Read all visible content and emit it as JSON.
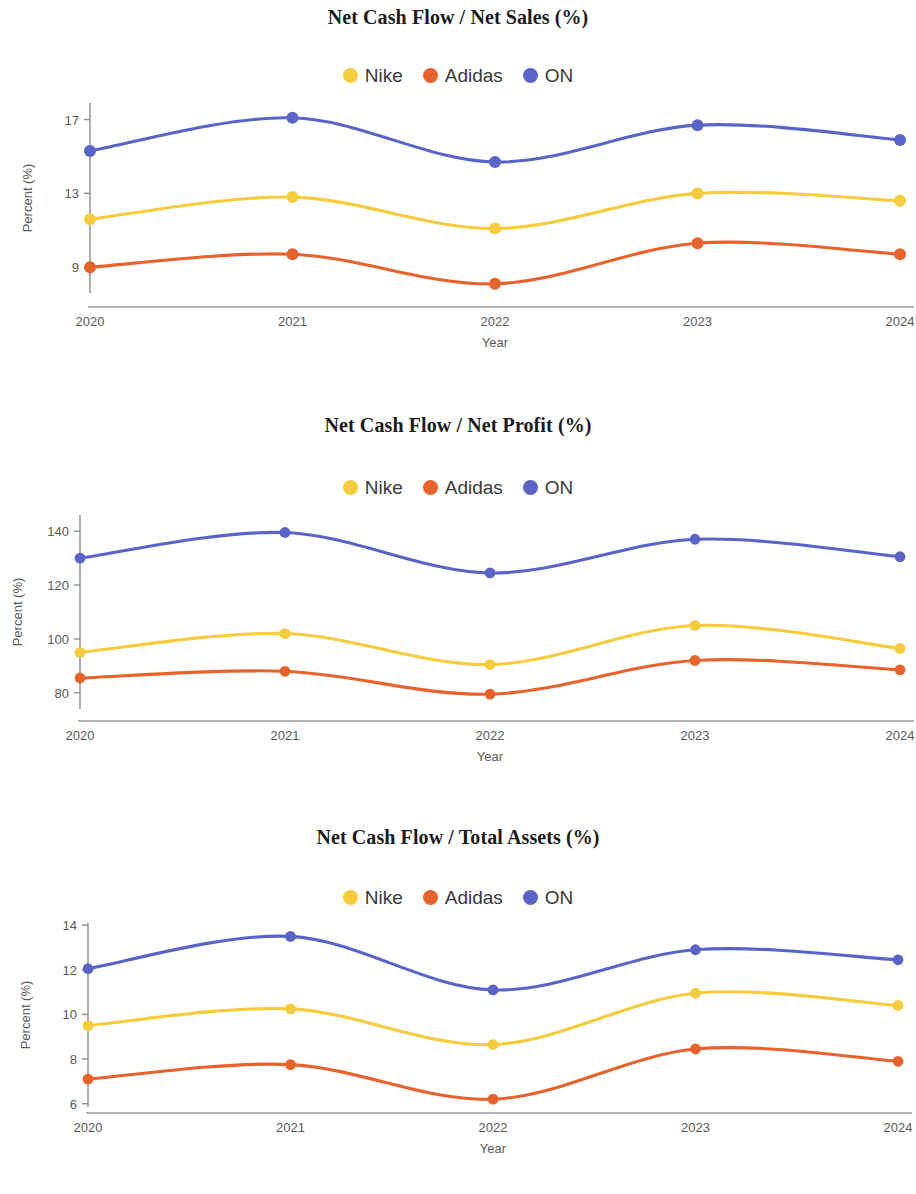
{
  "page": {
    "background": "#ffffff",
    "axis_label_x": "Year",
    "axis_label_y": "Percent (%)"
  },
  "legend": {
    "items": [
      {
        "label": "Nike",
        "color": "#f6cb3c"
      },
      {
        "label": "Adidas",
        "color": "#e8622c"
      },
      {
        "label": "ON",
        "color": "#5a64c8"
      }
    ]
  },
  "colors": {
    "nike": "#f6cb3c",
    "adidas": "#e8622c",
    "on": "#5a64c8",
    "axis": "#8b8b93",
    "tick_text": "#5a5a5a",
    "title": "#1b1b1b"
  },
  "charts": [
    {
      "id": "net-cash-flow-net-sales",
      "title": "Net Cash Flow / Net Sales (%)",
      "ticks_y": [
        "17",
        "13",
        "9"
      ]
    },
    {
      "id": "net-cash-flow-net-profit",
      "title": "Net Cash Flow / Net Profit (%)",
      "ticks_y": [
        "140",
        "120",
        "100",
        "80"
      ]
    },
    {
      "id": "net-cash-flow-total-assets",
      "title": "Net Cash Flow / Total Assets (%)",
      "ticks_y": [
        "14",
        "12",
        "10",
        "8",
        "6"
      ]
    }
  ],
  "chart_data": [
    {
      "type": "line",
      "title": "Net Cash Flow / Net Sales (%)",
      "xlabel": "Year",
      "ylabel": "Percent (%)",
      "categories": [
        "2020",
        "2021",
        "2022",
        "2023",
        "2024"
      ],
      "x": [
        2020,
        2021,
        2022,
        2023,
        2024
      ],
      "yticks": [
        9,
        13,
        17
      ],
      "ylim": [
        7.6,
        17.9
      ],
      "grid": false,
      "legend_position": "top-center",
      "smooth": true,
      "series": [
        {
          "name": "Nike",
          "color": "#f6cb3c",
          "values": [
            11.6,
            12.8,
            11.1,
            13.0,
            12.6
          ]
        },
        {
          "name": "Adidas",
          "color": "#e8622c",
          "values": [
            9.0,
            9.7,
            8.1,
            10.3,
            9.7
          ]
        },
        {
          "name": "ON",
          "color": "#5a64c8",
          "values": [
            15.3,
            17.1,
            14.7,
            16.7,
            15.9
          ]
        }
      ]
    },
    {
      "type": "line",
      "title": "Net Cash Flow / Net Profit (%)",
      "xlabel": "Year",
      "ylabel": "Percent (%)",
      "categories": [
        "2020",
        "2021",
        "2022",
        "2023",
        "2024"
      ],
      "x": [
        2020,
        2021,
        2022,
        2023,
        2024
      ],
      "yticks": [
        80,
        100,
        120,
        140
      ],
      "ylim": [
        74,
        146
      ],
      "grid": false,
      "legend_position": "top-center",
      "smooth": true,
      "series": [
        {
          "name": "Nike",
          "color": "#f6cb3c",
          "values": [
            95,
            102,
            90.5,
            105,
            96.5
          ]
        },
        {
          "name": "Adidas",
          "color": "#e8622c",
          "values": [
            85.5,
            88,
            79.5,
            92,
            88.5
          ]
        },
        {
          "name": "ON",
          "color": "#5a64c8",
          "values": [
            130,
            139.5,
            124.5,
            137,
            130.5
          ]
        }
      ]
    },
    {
      "type": "line",
      "title": "Net Cash Flow / Total Assets (%)",
      "xlabel": "Year",
      "ylabel": "Percent (%)",
      "categories": [
        "2020",
        "2021",
        "2022",
        "2023",
        "2024"
      ],
      "x": [
        2020,
        2021,
        2022,
        2023,
        2024
      ],
      "yticks": [
        6,
        8,
        10,
        12,
        14
      ],
      "ylim": [
        5.85,
        14.1
      ],
      "grid": false,
      "legend_position": "top-center",
      "smooth": true,
      "series": [
        {
          "name": "Nike",
          "color": "#f6cb3c",
          "values": [
            9.5,
            10.25,
            8.65,
            10.95,
            10.4
          ]
        },
        {
          "name": "Adidas",
          "color": "#e8622c",
          "values": [
            7.1,
            7.75,
            6.2,
            8.45,
            7.9
          ]
        },
        {
          "name": "ON",
          "color": "#5a64c8",
          "values": [
            12.05,
            13.5,
            11.1,
            12.9,
            12.45
          ]
        }
      ]
    }
  ]
}
